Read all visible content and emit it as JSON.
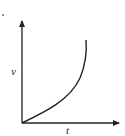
{
  "figure": {
    "type": "velocity-time graph",
    "y_axis_label": "v",
    "x_axis_label": "t",
    "curve_description": "starts at origin, increasing with increasing slope (concave up)",
    "colors": {
      "line": "#222222",
      "background": "#ffffff"
    }
  }
}
